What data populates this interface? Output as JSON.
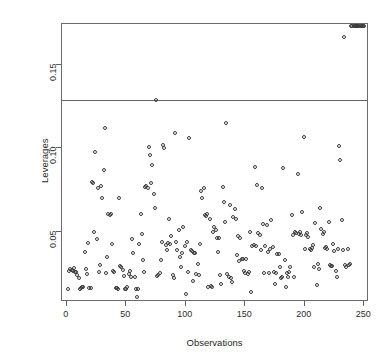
{
  "chart_data": {
    "type": "scatter",
    "title": "",
    "xlabel": "Observations",
    "ylabel": "Leverages",
    "xlim": [
      -4,
      254
    ],
    "ylim": [
      0.008,
      0.1745
    ],
    "xticks": [
      0,
      50,
      100,
      150,
      200,
      250
    ],
    "xticklabels": [
      "0",
      "50",
      "100",
      "150",
      "200",
      "250"
    ],
    "yticks": [
      0.05,
      0.1,
      0.15
    ],
    "yticklabels": [
      "0.05",
      "0.10",
      "0.15"
    ],
    "grid": false,
    "legend": null,
    "marker": "open-circle",
    "marker_color": "#3a3a3a",
    "reference_line": {
      "orientation": "horizontal",
      "y": 0.129,
      "color": "#636363",
      "label": ""
    },
    "n_points": 250,
    "x": [
      1,
      2,
      3,
      4,
      5,
      6,
      7,
      8,
      9,
      10,
      11,
      12,
      13,
      14,
      15,
      16,
      17,
      18,
      19,
      20,
      21,
      22,
      23,
      24,
      25,
      26,
      27,
      28,
      29,
      30,
      31,
      32,
      33,
      34,
      35,
      36,
      37,
      38,
      39,
      40,
      41,
      42,
      43,
      44,
      45,
      46,
      47,
      48,
      49,
      50,
      51,
      52,
      53,
      54,
      55,
      56,
      57,
      58,
      59,
      60,
      61,
      62,
      63,
      64,
      65,
      66,
      67,
      68,
      69,
      70,
      71,
      72,
      73,
      74,
      75,
      76,
      77,
      78,
      79,
      80,
      81,
      82,
      83,
      84,
      85,
      86,
      87,
      88,
      89,
      90,
      91,
      92,
      93,
      94,
      95,
      96,
      97,
      98,
      99,
      100,
      101,
      102,
      103,
      104,
      105,
      106,
      107,
      108,
      109,
      110,
      111,
      112,
      113,
      114,
      115,
      116,
      117,
      118,
      119,
      120,
      121,
      122,
      123,
      124,
      125,
      126,
      127,
      128,
      129,
      130,
      131,
      132,
      133,
      134,
      135,
      136,
      137,
      138,
      139,
      140,
      141,
      142,
      143,
      144,
      145,
      146,
      147,
      148,
      149,
      150,
      151,
      152,
      153,
      154,
      155,
      156,
      157,
      158,
      159,
      160,
      161,
      162,
      163,
      164,
      165,
      166,
      167,
      168,
      169,
      170,
      171,
      172,
      173,
      174,
      175,
      176,
      177,
      178,
      179,
      180,
      181,
      182,
      183,
      184,
      185,
      186,
      187,
      188,
      189,
      190,
      191,
      192,
      193,
      194,
      195,
      196,
      197,
      198,
      199,
      200,
      201,
      202,
      203,
      204,
      205,
      206,
      207,
      208,
      209,
      210,
      211,
      212,
      213,
      214,
      215,
      216,
      217,
      218,
      219,
      220,
      221,
      222,
      223,
      224,
      225,
      226,
      227,
      228,
      229,
      230,
      231,
      232,
      233,
      234,
      235,
      236,
      237,
      238,
      239,
      240,
      241,
      242,
      243,
      244,
      245,
      246,
      247,
      248,
      249,
      250
    ],
    "y": [
      0.0155,
      0.0265,
      0.028,
      0.0272,
      0.0268,
      0.0285,
      0.0262,
      0.0258,
      0.024,
      0.0225,
      0.016,
      0.0162,
      0.017,
      0.0168,
      0.038,
      0.028,
      0.0248,
      0.0432,
      0.0165,
      0.0162,
      0.08,
      0.079,
      0.05,
      0.098,
      0.046,
      0.076,
      0.0262,
      0.03,
      0.0772,
      0.07,
      0.087,
      0.112,
      0.0255,
      0.0352,
      0.061,
      0.06,
      0.0605,
      0.043,
      0.0268,
      0.0258,
      0.0162,
      0.0165,
      0.016,
      0.0705,
      0.0295,
      0.029,
      0.0272,
      0.0235,
      0.0158,
      0.016,
      0.017,
      0.025,
      0.0265,
      0.0228,
      0.046,
      0.0372,
      0.023,
      0.0158,
      0.011,
      0.016,
      0.0425,
      0.0608,
      0.049,
      0.0332,
      0.0258,
      0.077,
      0.0775,
      0.0765,
      0.101,
      0.096,
      0.079,
      0.09,
      0.0725,
      0.064,
      0.129,
      0.0235,
      0.024,
      0.0255,
      0.033,
      0.044,
      0.102,
      0.1,
      0.042,
      0.039,
      0.0432,
      0.058,
      0.043,
      0.0478,
      0.024,
      0.0222,
      0.109,
      0.044,
      0.039,
      0.051,
      0.035,
      0.0292,
      0.0375,
      0.053,
      0.0415,
      0.013,
      0.044,
      0.026,
      0.106,
      0.039,
      0.0385,
      0.0208,
      0.0372,
      0.0375,
      0.025,
      0.0305,
      0.024,
      0.043,
      0.0745,
      0.07,
      0.076,
      0.06,
      0.0598,
      0.061,
      0.0168,
      0.058,
      0.0175,
      0.017,
      0.05,
      0.053,
      0.051,
      0.0465,
      0.038,
      0.0465,
      0.0242,
      0.019,
      0.077,
      0.068,
      0.056,
      0.115,
      0.025,
      0.0232,
      0.066,
      0.0222,
      0.0198,
      0.059,
      0.0638,
      0.058,
      0.036,
      0.0475,
      0.0325,
      0.0465,
      0.034,
      0.034,
      0.0265,
      0.0255,
      0.0335,
      0.025,
      0.026,
      0.05,
      0.014,
      0.0415,
      0.042,
      0.089,
      0.0418,
      0.0782,
      0.0492,
      0.0482,
      0.039,
      0.076,
      0.0545,
      0.0255,
      0.0415,
      0.054,
      0.038,
      0.0255,
      0.04,
      0.057,
      0.041,
      0.0258,
      0.019,
      0.0252,
      0.0368,
      0.037,
      0.0292,
      0.0225,
      0.023,
      0.088,
      0.033,
      0.0172,
      0.0252,
      0.023,
      0.026,
      0.029,
      0.06,
      0.048,
      0.023,
      0.0502,
      0.0495,
      0.0845,
      0.0488,
      0.05,
      0.048,
      0.062,
      0.107,
      0.04,
      0.048,
      0.0495,
      0.047,
      0.0398,
      0.039,
      0.0405,
      0.042,
      0.029,
      0.0555,
      0.018,
      0.031,
      0.028,
      0.064,
      0.052,
      0.049,
      0.05,
      0.0405,
      0.041,
      0.0398,
      0.056,
      0.03,
      0.0295,
      0.0298,
      0.043,
      0.0388,
      0.0265,
      0.023,
      0.0398,
      0.1015,
      0.093,
      0.057,
      0.039,
      0.167,
      0.03,
      0.029,
      0.04,
      0.03,
      0.0305
    ]
  },
  "labels": {
    "y_axis_title": "Leverages",
    "x_axis_title": "Observations"
  }
}
